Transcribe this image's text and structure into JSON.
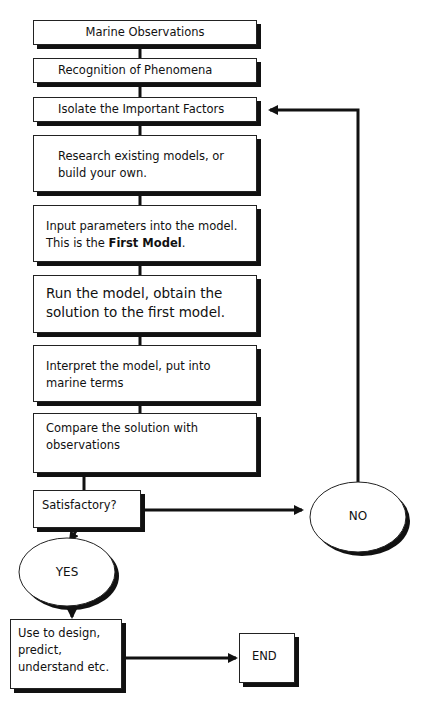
{
  "diagram": {
    "steps": [
      {
        "id": "marine-observations",
        "text": "Marine Observations"
      },
      {
        "id": "recognition",
        "text": "Recognition of Phenomena"
      },
      {
        "id": "isolate",
        "text": "Isolate the Important Factors"
      },
      {
        "id": "research",
        "line1": "Research existing models, or",
        "line2": "build your own."
      },
      {
        "id": "input",
        "line1": "Input parameters into the model.",
        "line2_prefix": "This is the ",
        "line2_bold": "First Model",
        "line2_suffix": "."
      },
      {
        "id": "run",
        "line1": "Run the model, obtain the",
        "line2": "solution to the first model."
      },
      {
        "id": "interpret",
        "line1": "Interpret the model, put into",
        "line2": "marine terms"
      },
      {
        "id": "compare",
        "line1": "Compare the solution with",
        "line2": "observations"
      }
    ],
    "decision": "Satisfactory?",
    "no_label": "NO",
    "yes_label": "YES",
    "use": {
      "line1": "Use to design,",
      "line2": "predict,",
      "line3": "understand etc."
    },
    "end_label": "END"
  }
}
